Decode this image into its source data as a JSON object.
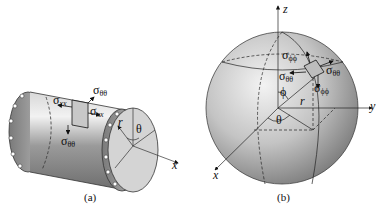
{
  "figure": {
    "panel_a": {
      "caption": "(a)",
      "object": "thin-walled cylinder with flanged ends",
      "labels": {
        "sigma_theta_theta_top": {
          "symbol": "σ",
          "sub": "θθ"
        },
        "sigma_xx_left": {
          "symbol": "σ",
          "sub": "xx"
        },
        "sigma_xx_right": {
          "symbol": "σ",
          "sub": "xx"
        },
        "sigma_theta_theta_bottom": {
          "symbol": "σ",
          "sub": "θθ"
        },
        "radius": "r",
        "angle": "θ",
        "axis_x": "x"
      }
    },
    "panel_b": {
      "caption": "(b)",
      "object": "sphere with spherical coordinates",
      "labels": {
        "axis_z": "z",
        "axis_y": "y",
        "axis_x": "x",
        "sigma_phi_phi_top": {
          "symbol": "σ",
          "sub": "ϕϕ"
        },
        "sigma_theta_theta_right": {
          "symbol": "σ",
          "sub": "θθ"
        },
        "sigma_theta_theta_left": {
          "symbol": "σ",
          "sub": "θθ"
        },
        "sigma_phi_phi_bottom": {
          "symbol": "σ",
          "sub": "ϕϕ"
        },
        "angle_phi": "ϕ",
        "radius": "r",
        "angle_theta": "θ"
      }
    }
  }
}
